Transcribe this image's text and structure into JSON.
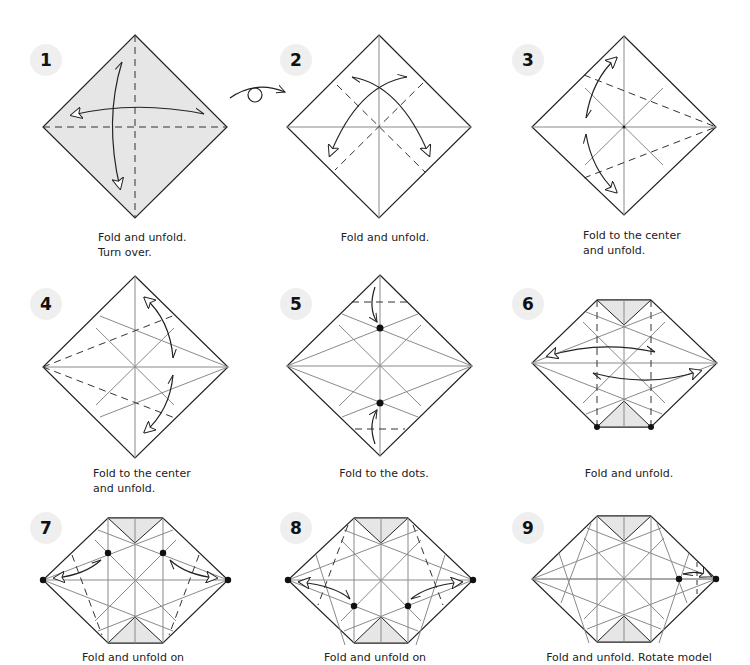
{
  "colors": {
    "paper_fill_colored": "#e6e6e6",
    "paper_fill_white": "#ffffff",
    "outline": "#222222",
    "crease": "#8a8a8a",
    "fold_line": "#333333",
    "badge_bg": "#efefef"
  },
  "turn_over_symbol": "turn-over-icon",
  "steps": [
    {
      "number": "1",
      "caption_lines": [
        "Fold and unfold.",
        "Turn over."
      ],
      "caption": "Fold and unfold.\nTurn over."
    },
    {
      "number": "2",
      "caption_lines": [
        "Fold and unfold."
      ],
      "caption": "Fold and unfold."
    },
    {
      "number": "3",
      "caption_lines": [
        "Fold to the center",
        "and unfold."
      ],
      "caption": "Fold to the center\nand unfold."
    },
    {
      "number": "4",
      "caption_lines": [
        "Fold to the center",
        "and unfold."
      ],
      "caption": "Fold to the center\nand unfold."
    },
    {
      "number": "5",
      "caption_lines": [
        "Fold to the dots."
      ],
      "caption": "Fold to the dots."
    },
    {
      "number": "6",
      "caption_lines": [
        "Fold and unfold."
      ],
      "caption": "Fold and unfold."
    },
    {
      "number": "7",
      "caption_lines": [
        "Fold and unfold on"
      ],
      "caption": "Fold and unfold on"
    },
    {
      "number": "8",
      "caption_lines": [
        "Fold and unfold on"
      ],
      "caption": "Fold and unfold on"
    },
    {
      "number": "9",
      "caption_lines": [
        "Fold and unfold. Rotate model"
      ],
      "caption": "Fold and unfold. Rotate model"
    }
  ]
}
